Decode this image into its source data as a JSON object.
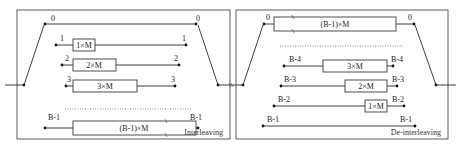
{
  "interleaver": {
    "title": "Interleaving",
    "branches": [
      {
        "index_left": "0",
        "index_right": "0",
        "delay": ""
      },
      {
        "index_left": "1",
        "index_right": "1",
        "delay": "1×M"
      },
      {
        "index_left": "2",
        "index_right": "2",
        "delay": "2×M"
      },
      {
        "index_left": "3",
        "index_right": "3",
        "delay": "3×M"
      },
      {
        "index_left": "B-1",
        "index_right": "B-1",
        "delay": "(B-1)×M"
      }
    ]
  },
  "deinterleaver": {
    "title": "De-interleaving",
    "branches": [
      {
        "index_left": "0",
        "index_right": "0",
        "delay": "(B-1)×M"
      },
      {
        "index_left": "B-4",
        "index_right": "B-4",
        "delay": "3×M"
      },
      {
        "index_left": "B-3",
        "index_right": "B-3",
        "delay": "2×M"
      },
      {
        "index_left": "B-2",
        "index_right": "B-2",
        "delay": "1×M"
      },
      {
        "index_left": "B-1",
        "index_right": "B-1",
        "delay": ""
      }
    ]
  }
}
